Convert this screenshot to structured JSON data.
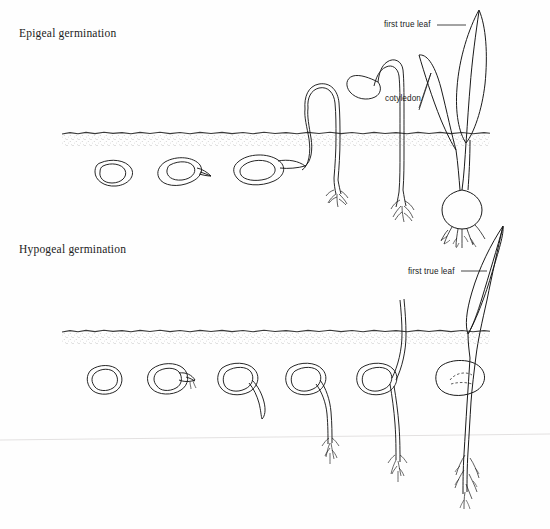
{
  "figure": {
    "width": 550,
    "height": 529,
    "background_color": "#fefefe",
    "ink_color": "#1a1a1a",
    "soil_color": "#555555",
    "artifact_line_color": "#e0dede"
  },
  "sections": [
    {
      "id": "epigeal",
      "title": "Epigeal germination",
      "soil_line_y": 133,
      "stage_count": 6,
      "description": "cotyledons raised above the soil by hypocotyl elongation"
    },
    {
      "id": "hypogeal",
      "title": "Hypogeal germination",
      "soil_line_y": 331,
      "stage_count": 6,
      "description": "cotyledons remain below the soil; epicotyl elongates"
    }
  ],
  "labels": [
    {
      "id": "first-true-leaf-epigeal",
      "text": "first true leaf",
      "section": "epigeal"
    },
    {
      "id": "cotyledon-epigeal",
      "text": "cotyledon",
      "section": "epigeal"
    },
    {
      "id": "first-true-leaf-hypogeal",
      "text": "first true leaf",
      "section": "hypogeal"
    }
  ]
}
